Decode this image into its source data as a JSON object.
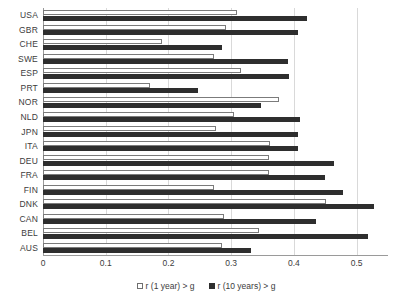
{
  "chart_data": {
    "type": "bar",
    "orientation": "horizontal",
    "title": "",
    "xlabel": "",
    "ylabel": "",
    "xlim": [
      0,
      0.55
    ],
    "xticks": [
      "0",
      "0.1",
      "0.2",
      "0.3",
      "0.4",
      "0.5"
    ],
    "xtick_values": [
      0,
      0.1,
      0.2,
      0.3,
      0.4,
      0.5
    ],
    "grid": true,
    "legend_position": "bottom",
    "categories": [
      "USA",
      "GBR",
      "CHE",
      "SWE",
      "ESP",
      "PRT",
      "NOR",
      "NLD",
      "JPN",
      "ITA",
      "DEU",
      "FRA",
      "FIN",
      "DNK",
      "CAN",
      "BEL",
      "AUS"
    ],
    "series": [
      {
        "name": "r (1 year) > g",
        "style": "hollow",
        "color": "#ffffff",
        "edgecolor": "#7b7b7b",
        "values": [
          0.31,
          0.291,
          0.189,
          0.273,
          0.315,
          0.171,
          0.376,
          0.304,
          0.275,
          0.362,
          0.361,
          0.361,
          0.272,
          0.451,
          0.289,
          0.345,
          0.286
        ]
      },
      {
        "name": "r (10 years) > g",
        "style": "filled",
        "color": "#2e2e2e",
        "values": [
          0.421,
          0.407,
          0.286,
          0.39,
          0.392,
          0.247,
          0.347,
          0.41,
          0.406,
          0.407,
          0.464,
          0.45,
          0.478,
          0.527,
          0.435,
          0.518,
          0.332
        ]
      }
    ]
  }
}
